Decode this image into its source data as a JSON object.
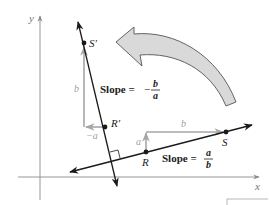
{
  "figure": {
    "axes": {
      "x_label": "x",
      "y_label": "y"
    },
    "points": {
      "S_prime": "S′",
      "R_prime": "R′",
      "R": "R",
      "S": "S"
    },
    "vectors": {
      "rise_a": "a",
      "run_b": "b",
      "neg_a": "−a",
      "rise_b": "b"
    },
    "slopes": {
      "perpendicular": {
        "prefix": "Slope =",
        "sign": "−",
        "numerator": "b",
        "denominator": "a"
      },
      "original": {
        "prefix": "Slope =",
        "numerator": "a",
        "denominator": "b"
      }
    },
    "colors": {
      "line": "#1a1a1a",
      "axis": "#8a8a8a",
      "vector": "#a6a6a6",
      "rotation_arrow_fill": "#d9d9d9",
      "rotation_arrow_stroke": "#555555"
    }
  }
}
